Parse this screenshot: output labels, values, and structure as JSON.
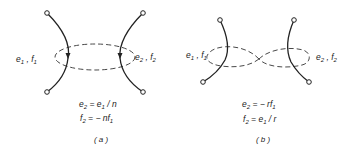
{
  "figure": {
    "panel_a": {
      "caption": "( a )",
      "label_left": {
        "e": "e",
        "e_sub": "1",
        "sep": " , ",
        "f": "f",
        "f_sub": "1"
      },
      "label_right": {
        "e": "e",
        "e_sub": "2",
        "sep": " , ",
        "f": "f",
        "f_sub": "2"
      },
      "equations": [
        {
          "lhs": "e",
          "lhs_sub": "2",
          "rhs": " =  e",
          "rhs_sub": "1",
          "tail": " / n"
        },
        {
          "lhs": "f",
          "lhs_sub": "2",
          "rhs": " =  − nf",
          "rhs_sub": "1",
          "tail": ""
        }
      ],
      "coupling": "single-loop",
      "arrows": "downward on both ports"
    },
    "panel_b": {
      "caption": "( b )",
      "label_left": {
        "e": "e",
        "e_sub": "1",
        "sep": " , ",
        "f": "f",
        "f_sub": "1"
      },
      "label_right": {
        "e": "e",
        "e_sub": "2",
        "sep": " , ",
        "f": "f",
        "f_sub": "2"
      },
      "equations": [
        {
          "lhs": "e",
          "lhs_sub": "2",
          "rhs": " =  − rf",
          "rhs_sub": "1",
          "tail": ""
        },
        {
          "lhs": "f",
          "lhs_sub": "2",
          "rhs": " =  e",
          "rhs_sub": "1",
          "tail": " / r"
        }
      ],
      "coupling": "figure-eight (crossed)"
    }
  }
}
